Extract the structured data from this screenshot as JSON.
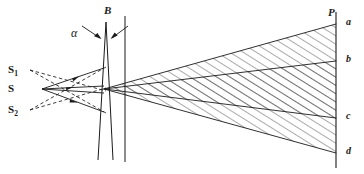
{
  "figure": {
    "type": "optics-ray-diagram",
    "width": 364,
    "height": 174,
    "background_color": "#ffffff",
    "stroke_color": "#1a1a1a"
  },
  "labels": {
    "source": "S",
    "virtual_source_upper": "S",
    "virtual_source_upper_sub": "1",
    "virtual_source_lower": "S",
    "virtual_source_lower_sub": "2",
    "biprism": "B",
    "apex_angle": "α",
    "screen": "P",
    "fringe_a": "a",
    "fringe_b": "b",
    "fringe_c": "c",
    "fringe_d": "d"
  },
  "geometry": {
    "source_point": {
      "x": 42,
      "y": 89
    },
    "virtual_source_upper_point": {
      "x": 30,
      "y": 70
    },
    "virtual_source_lower_point": {
      "x": 30,
      "y": 110
    },
    "biprism_apex": {
      "x": 106,
      "y": 22
    },
    "biprism_base": {
      "x": 110,
      "y": 160
    },
    "biprism_front_face_x": 102,
    "biprism_plane_line_x": 125,
    "beam_cross_point": {
      "x": 104,
      "y": 89
    },
    "screen_line_x": 336,
    "screen_top_y": 12,
    "screen_bottom_y": 168,
    "fringe_a_y": 24,
    "fringe_b_y": 61,
    "fringe_c_y": 118,
    "fringe_d_y": 153,
    "hatch_spacing": 7,
    "hatch_angle_deg": 60
  }
}
